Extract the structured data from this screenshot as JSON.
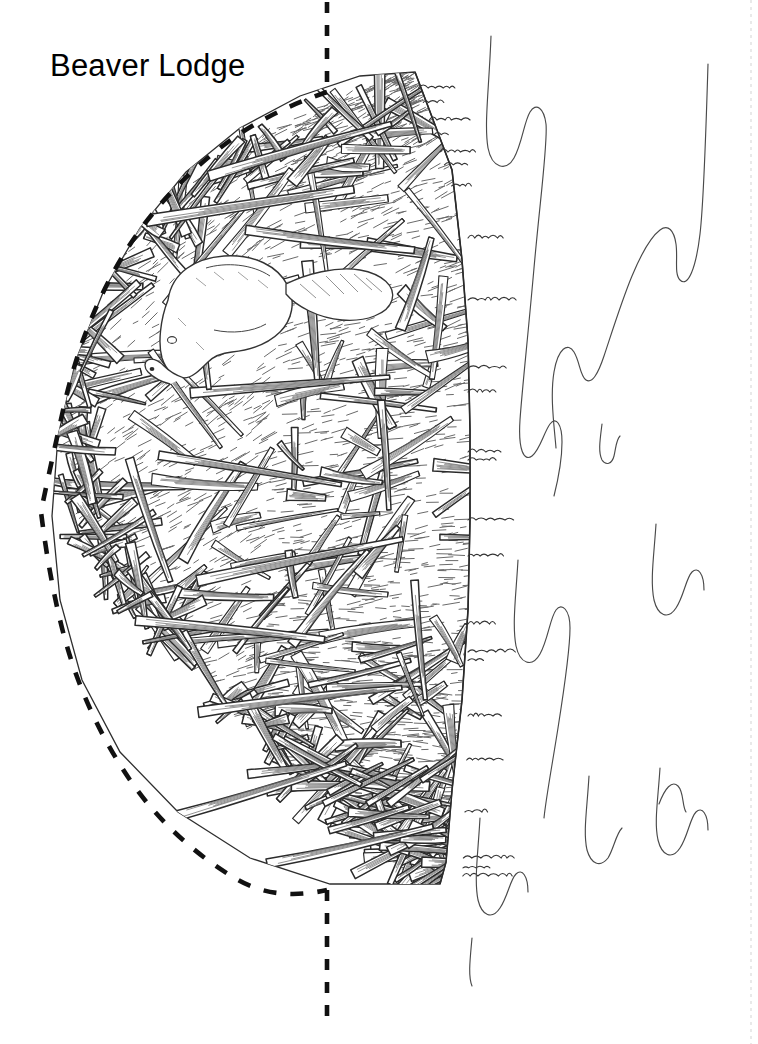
{
  "page": {
    "width": 758,
    "height": 1044,
    "background_color": "#ffffff",
    "kind": "naturalist-line-drawing"
  },
  "title": {
    "text": "Beaver Lodge",
    "color": "#000000",
    "x": 50,
    "y": 48,
    "font_size_px": 31
  },
  "illustration": {
    "subject": "Beaver lodge cutaway, half-section view",
    "description": "Pen-and-ink style cross-section of a beaver lodge built of interlocking sticks and branches with mud, a beaver resting near the upper left interior, dashed outline marking the submerged/cut boundary, and stylized water-ripple lines to the right.",
    "ink_color": "#3a3a3a",
    "outline_color": "#1a1a1a",
    "hatch_color": "#555555",
    "fill_color": "#ffffff",
    "elements": [
      {
        "name": "lodge-mound",
        "label": "Lodge mound of sticks and mud",
        "apex_x": 415,
        "apex_y": 72,
        "right_edge_x": 468,
        "bottom_y": 885,
        "left_extent_x": 48
      },
      {
        "name": "beaver",
        "label": "Beaver",
        "center_x": 205,
        "center_y": 312,
        "orientation": "head down-left, tail to the right"
      },
      {
        "name": "cut-line-vertical",
        "label": "Dashed section cut line",
        "x": 327,
        "top_segment": [
          0,
          92
        ],
        "bottom_segment": [
          888,
          1022
        ],
        "style": "dashed",
        "color": "#111111"
      },
      {
        "name": "cut-line-curve",
        "label": "Dashed lodge profile outline",
        "style": "dashed",
        "color": "#111111"
      },
      {
        "name": "water-ripples",
        "label": "Water surface ripple lines",
        "region_x": [
          480,
          720
        ],
        "region_y": [
          20,
          920
        ],
        "count": 8,
        "color": "#4a4a4a"
      },
      {
        "name": "page-fold-line",
        "label": "Faint page edge perforation",
        "x": 751,
        "color": "#e4e4e4"
      }
    ]
  }
}
